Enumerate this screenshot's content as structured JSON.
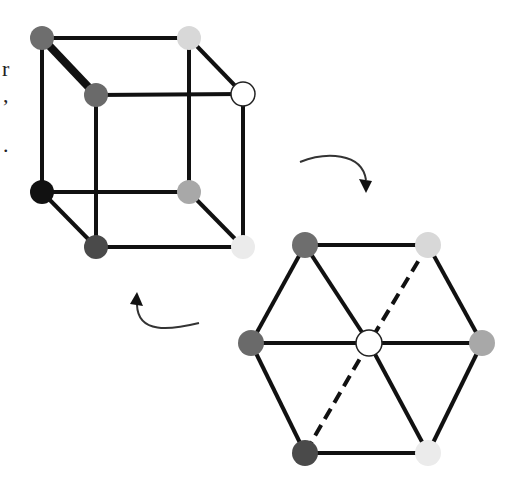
{
  "left_text_fragments": [
    {
      "text": "r",
      "x": 2,
      "y": 58
    },
    {
      "text": ",",
      "x": 3,
      "y": 84
    },
    {
      "text": ".",
      "x": 3,
      "y": 134
    }
  ],
  "colors": {
    "edge": "#111111",
    "arrow": "#333333",
    "node_outline": "#222222"
  },
  "cube": {
    "node_radius": 12,
    "nodes": [
      {
        "id": "back-top-left",
        "x": 42,
        "y": 38,
        "fill": "#6e6e6e"
      },
      {
        "id": "back-top-right",
        "x": 189,
        "y": 38,
        "fill": "#d8d8d8"
      },
      {
        "id": "back-bottom-left",
        "x": 42,
        "y": 192,
        "fill": "#111111"
      },
      {
        "id": "back-bottom-right",
        "x": 189,
        "y": 192,
        "fill": "#a8a8a8"
      },
      {
        "id": "front-top-left",
        "x": 96,
        "y": 95,
        "fill": "#6a6a6a"
      },
      {
        "id": "front-top-right",
        "x": 243,
        "y": 94,
        "fill": "#ffffff",
        "outline": true
      },
      {
        "id": "front-bottom-left",
        "x": 96,
        "y": 247,
        "fill": "#4a4a4a"
      },
      {
        "id": "front-bottom-right",
        "x": 243,
        "y": 247,
        "fill": "#ebebeb"
      }
    ],
    "edges": [
      {
        "from": "back-top-left",
        "to": "back-top-right",
        "width": 4
      },
      {
        "from": "back-top-left",
        "to": "back-bottom-left",
        "width": 4
      },
      {
        "from": "back-top-right",
        "to": "back-bottom-right",
        "width": 4
      },
      {
        "from": "back-bottom-left",
        "to": "back-bottom-right",
        "width": 4
      },
      {
        "from": "front-top-left",
        "to": "front-top-right",
        "width": 4
      },
      {
        "from": "front-top-left",
        "to": "front-bottom-left",
        "width": 4
      },
      {
        "from": "front-top-right",
        "to": "front-bottom-right",
        "width": 4
      },
      {
        "from": "front-bottom-left",
        "to": "front-bottom-right",
        "width": 4
      },
      {
        "from": "back-top-left",
        "to": "front-top-left",
        "width": 8
      },
      {
        "from": "back-top-right",
        "to": "front-top-right",
        "width": 4
      },
      {
        "from": "back-bottom-left",
        "to": "front-bottom-left",
        "width": 4
      },
      {
        "from": "back-bottom-right",
        "to": "front-bottom-right",
        "width": 4
      }
    ]
  },
  "hexagon": {
    "node_radius": 13,
    "nodes": [
      {
        "id": "hex-top-left",
        "x": 305,
        "y": 245,
        "fill": "#6e6e6e"
      },
      {
        "id": "hex-top-right",
        "x": 428,
        "y": 245,
        "fill": "#d8d8d8"
      },
      {
        "id": "hex-left",
        "x": 251,
        "y": 343,
        "fill": "#6a6a6a"
      },
      {
        "id": "hex-center",
        "x": 369,
        "y": 343,
        "fill": "#ffffff",
        "outline": true
      },
      {
        "id": "hex-right",
        "x": 482,
        "y": 343,
        "fill": "#a8a8a8"
      },
      {
        "id": "hex-bottom-left",
        "x": 305,
        "y": 453,
        "fill": "#4a4a4a"
      },
      {
        "id": "hex-bottom-right",
        "x": 428,
        "y": 453,
        "fill": "#ebebeb"
      }
    ],
    "edges": [
      {
        "from": "hex-top-left",
        "to": "hex-top-right",
        "dashed": false
      },
      {
        "from": "hex-top-right",
        "to": "hex-right",
        "dashed": false
      },
      {
        "from": "hex-right",
        "to": "hex-bottom-right",
        "dashed": false
      },
      {
        "from": "hex-bottom-right",
        "to": "hex-bottom-left",
        "dashed": false
      },
      {
        "from": "hex-bottom-left",
        "to": "hex-left",
        "dashed": false
      },
      {
        "from": "hex-left",
        "to": "hex-top-left",
        "dashed": false
      },
      {
        "from": "hex-left",
        "to": "hex-center",
        "dashed": false
      },
      {
        "from": "hex-center",
        "to": "hex-right",
        "dashed": false
      },
      {
        "from": "hex-top-left",
        "to": "hex-center",
        "dashed": false
      },
      {
        "from": "hex-center",
        "to": "hex-bottom-right",
        "dashed": false
      },
      {
        "from": "hex-top-right",
        "to": "hex-center",
        "dashed": true
      },
      {
        "from": "hex-center",
        "to": "hex-bottom-left",
        "dashed": true
      }
    ]
  },
  "arrows": [
    {
      "id": "arrow-cube-to-hexagon",
      "path": "M 300 162 C 325 152, 362 152, 366 180",
      "head": [
        366,
        193
      ],
      "head_dir": "down"
    },
    {
      "id": "arrow-hexagon-to-cube",
      "path": "M 199 323 C 170 330, 138 334, 137 305",
      "head": [
        137,
        292
      ],
      "head_dir": "up"
    }
  ]
}
